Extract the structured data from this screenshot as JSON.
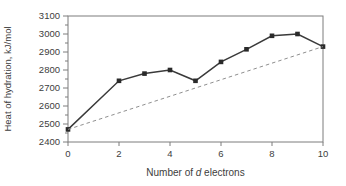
{
  "colors": {
    "background": "#ffffff",
    "frame": "#7d7d7d",
    "tick": "#7d7d7d",
    "text": "#3d3d3d",
    "solid_line": "#3a3a3a",
    "marker": "#2a2a2a",
    "dashed_line": "#8f8f8f"
  },
  "chart_data": {
    "type": "line",
    "title": "",
    "xlabel": "Number of d electrons",
    "xlabel_parts": {
      "prefix": "Number of ",
      "italic": "d",
      "suffix": " electrons"
    },
    "ylabel": "Heat of hydration, kJ/mol",
    "xlim": [
      0,
      10
    ],
    "ylim": [
      2400,
      3100
    ],
    "x_major_ticks": [
      0,
      2,
      4,
      6,
      8,
      10
    ],
    "x_tick_labels": [
      "0",
      "2",
      "4",
      "6",
      "8",
      "10"
    ],
    "y_major_ticks": [
      2400,
      2500,
      2600,
      2700,
      2800,
      2900,
      3000,
      3100
    ],
    "y_tick_labels": [
      "2400",
      "2500",
      "2600",
      "2700",
      "2800",
      "2900",
      "3000",
      "3100"
    ],
    "y_minor_step": 50,
    "grid": false,
    "legend": null,
    "series": [
      {
        "name": "heat-of-hydration",
        "style": "solid",
        "marker": "square",
        "x": [
          0,
          2,
          3,
          4,
          5,
          6,
          7,
          8,
          9,
          10
        ],
        "y": [
          2470,
          2740,
          2780,
          2800,
          2740,
          2845,
          2915,
          2990,
          3000,
          2930
        ]
      },
      {
        "name": "linear-reference",
        "style": "dashed",
        "marker": "none",
        "x": [
          0,
          10
        ],
        "y": [
          2470,
          2930
        ]
      }
    ]
  }
}
